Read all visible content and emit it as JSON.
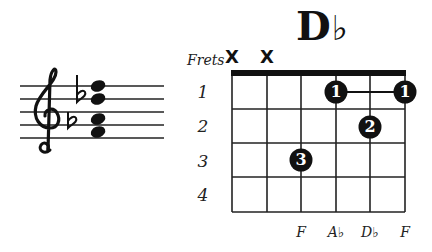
{
  "chord": {
    "root": "D",
    "accidental": "♭",
    "name": "D♭"
  },
  "diagram": {
    "frets_label": "Frets",
    "fret_numbers": [
      "1",
      "2",
      "3",
      "4"
    ],
    "string_states": [
      "X",
      "X",
      "",
      "",
      "",
      ""
    ],
    "note_labels": [
      "",
      "",
      "F",
      "A♭",
      "D♭",
      "F"
    ],
    "fingers": [
      {
        "string": 4,
        "fret": 1,
        "finger": "1"
      },
      {
        "string": 6,
        "fret": 1,
        "finger": "1"
      },
      {
        "string": 5,
        "fret": 2,
        "finger": "2"
      },
      {
        "string": 3,
        "fret": 3,
        "finger": "3"
      }
    ],
    "barre": {
      "fret": 1,
      "from_string": 4,
      "to_string": 6
    }
  },
  "staff": {
    "clef": "treble-clef",
    "key_signature": [
      "♭",
      "♭"
    ],
    "chord_notes": [
      "F",
      "A♭",
      "D♭",
      "F"
    ]
  },
  "colors": {
    "ink": "#111111",
    "background": "#ffffff",
    "dot_text": "#ffffff"
  }
}
